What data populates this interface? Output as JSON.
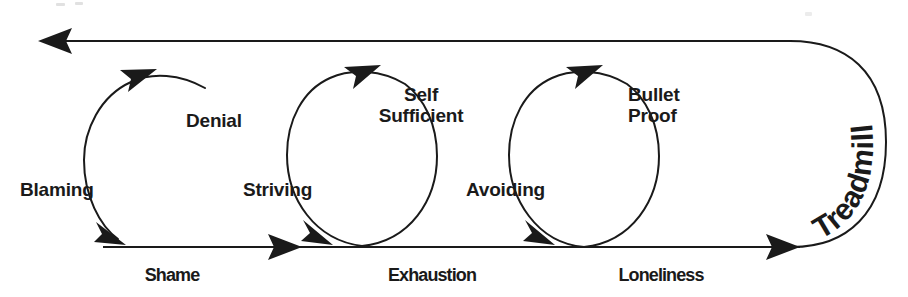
{
  "diagram": {
    "title": "Treadmill",
    "type": "cycle-loop-diagram",
    "colors": {
      "ink": "#1a1a1a",
      "background": "#ffffff"
    },
    "loop_label": "Treadmill",
    "cycles": [
      {
        "id": "cycle-1",
        "inner_label": "Denial",
        "side_label": "Blaming",
        "stage_label": "Shame"
      },
      {
        "id": "cycle-2",
        "inner_label_line1": "Self",
        "inner_label_line2": "Sufficient",
        "side_label": "Striving",
        "stage_label": "Exhaustion"
      },
      {
        "id": "cycle-3",
        "inner_label_line1": "Bullet",
        "inner_label_line2": "Proof",
        "side_label": "Avoiding",
        "stage_label": "Loneliness"
      }
    ],
    "flow": {
      "bottom_direction": "left-to-right",
      "top_direction": "right-to-left"
    }
  }
}
